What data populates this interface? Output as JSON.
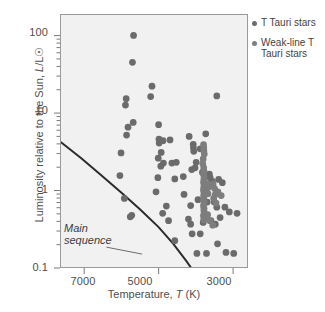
{
  "chart_data": {
    "type": "scatter",
    "title": "",
    "xlabel": "Temperature, T (K)",
    "ylabel": "Luminosity relative to the Sun, L/L☉",
    "xscale": "linear-reversed",
    "yscale": "log",
    "xlim": [
      7650,
      2600
    ],
    "ylim": [
      0.1,
      190
    ],
    "grid": false,
    "legend_position": "outside-right-top",
    "xticks": [
      7000,
      5000,
      3000
    ],
    "xtick_labels": [
      "7000",
      "5000",
      "3000"
    ],
    "yticks": [
      0.1,
      1,
      10,
      100
    ],
    "ytick_labels": [
      "0.1",
      "1",
      "10",
      "100"
    ],
    "annotations": [
      {
        "text_line1": "Main",
        "text_line2": "sequence",
        "style": "italic",
        "leader": "points up-right to the main-sequence curve"
      }
    ],
    "curves": [
      {
        "name": "main-sequence",
        "label": "Main sequence",
        "color": "#2b2b2b",
        "width": 2,
        "points": [
          [
            7650,
            4.2
          ],
          [
            7100,
            2.6
          ],
          [
            6550,
            1.55
          ],
          [
            6000,
            0.92
          ],
          [
            5500,
            0.56
          ],
          [
            5000,
            0.33
          ],
          [
            4600,
            0.2
          ],
          [
            4250,
            0.12
          ],
          [
            4120,
            0.098
          ]
        ]
      }
    ],
    "series": [
      {
        "name": "T Tauri stars",
        "marker": "circle",
        "color": "#6b6b6b",
        "size": 3.4,
        "points": [
          [
            5680,
            103
          ],
          [
            5710,
            46
          ],
          [
            5880,
            15.5
          ],
          [
            5900,
            12.8
          ],
          [
            5180,
            22.5
          ],
          [
            5215,
            16.5
          ],
          [
            3420,
            16.8
          ],
          [
            5830,
            6.6
          ],
          [
            5870,
            5.2
          ],
          [
            5690,
            7.6
          ],
          [
            5000,
            7.1
          ],
          [
            4990,
            4.6
          ],
          [
            4985,
            4.1
          ],
          [
            4880,
            4.4
          ],
          [
            4690,
            4.5
          ],
          [
            4170,
            5.0
          ],
          [
            3720,
            5.4
          ],
          [
            4060,
            3.95
          ],
          [
            4055,
            3.55
          ],
          [
            4045,
            3.2
          ],
          [
            3870,
            3.45
          ],
          [
            4930,
            3.1
          ],
          [
            6020,
            3.05
          ],
          [
            5010,
            2.6
          ],
          [
            4870,
            2.25
          ],
          [
            4940,
            2.05
          ],
          [
            4640,
            2.25
          ],
          [
            4520,
            2.3
          ],
          [
            3980,
            2.3
          ],
          [
            4010,
            1.95
          ],
          [
            6050,
            1.55
          ],
          [
            5020,
            1.45
          ],
          [
            4560,
            1.4
          ],
          [
            4330,
            1.5
          ],
          [
            4100,
            1.85
          ],
          [
            3810,
            1.7
          ],
          [
            3620,
            1.62
          ],
          [
            3600,
            1.45
          ],
          [
            3540,
            1.3
          ],
          [
            3560,
            1.15
          ],
          [
            3370,
            1.38
          ],
          [
            3270,
            1.25
          ],
          [
            5930,
            0.78
          ],
          [
            5070,
            0.95
          ],
          [
            4790,
            0.62
          ],
          [
            4310,
            0.88
          ],
          [
            4130,
            0.63
          ],
          [
            3930,
            0.75
          ],
          [
            3680,
            0.7
          ],
          [
            3490,
            0.7
          ],
          [
            3420,
            0.6
          ],
          [
            3200,
            0.6
          ],
          [
            3080,
            0.52
          ],
          [
            2870,
            0.5
          ],
          [
            5770,
            0.45
          ],
          [
            5730,
            0.47
          ],
          [
            4890,
            0.5
          ],
          [
            4730,
            0.4
          ],
          [
            4190,
            0.42
          ],
          [
            4130,
            0.36
          ],
          [
            3790,
            0.38
          ],
          [
            3580,
            0.4
          ],
          [
            3460,
            0.36
          ],
          [
            3330,
            0.44
          ],
          [
            4560,
            0.22
          ],
          [
            4090,
            0.27
          ],
          [
            3960,
            0.15
          ],
          [
            3700,
            0.15
          ],
          [
            3400,
            0.2
          ],
          [
            3170,
            0.155
          ],
          [
            2960,
            0.15
          ],
          [
            3870,
            0.27
          ]
        ]
      },
      {
        "name": "Weak-line T Tauri stars",
        "marker": "circle",
        "color": "#7d7d7d",
        "size": 3.4,
        "points": [
          [
            3780,
            3.9
          ],
          [
            3775,
            3.55
          ],
          [
            3770,
            3.25
          ],
          [
            3760,
            2.95
          ],
          [
            3790,
            2.55
          ],
          [
            3800,
            2.2
          ],
          [
            3775,
            1.95
          ],
          [
            3770,
            1.78
          ],
          [
            3782,
            1.62
          ],
          [
            3768,
            1.48
          ],
          [
            3772,
            1.36
          ],
          [
            3779,
            1.26
          ],
          [
            3766,
            1.17
          ],
          [
            3774,
            1.08
          ],
          [
            3781,
            1.0
          ],
          [
            3763,
            0.93
          ],
          [
            3776,
            0.86
          ],
          [
            3770,
            0.8
          ],
          [
            3784,
            0.745
          ],
          [
            3762,
            0.7
          ],
          [
            3773,
            0.655
          ],
          [
            3779,
            0.615
          ],
          [
            3767,
            0.575
          ],
          [
            3771,
            0.54
          ],
          [
            3758,
            0.5
          ],
          [
            3783,
            0.465
          ],
          [
            3765,
            0.435
          ],
          [
            3774,
            0.41
          ],
          [
            3690,
            1.22
          ],
          [
            3700,
            1.02
          ],
          [
            3660,
            0.9
          ],
          [
            3640,
            1.1
          ],
          [
            3520,
            1.2
          ],
          [
            3480,
            1.05
          ],
          [
            3460,
            0.88
          ],
          [
            3505,
            0.78
          ],
          [
            3440,
            0.68
          ],
          [
            3390,
            0.95
          ],
          [
            3300,
            0.85
          ],
          [
            3670,
            0.48
          ],
          [
            3610,
            0.4
          ],
          [
            3530,
            0.35
          ]
        ]
      }
    ]
  },
  "legend": {
    "items": [
      {
        "label": "T Tauri stars",
        "color": "#6b6b6b"
      },
      {
        "label": "Weak-line T Tauri stars",
        "color": "#7d7d7d"
      }
    ]
  },
  "axes": {
    "x_title_main": "Temperature,",
    "x_title_italic": "T",
    "x_title_unit": "(K)",
    "y_title_main": "Luminosity relative to the Sun,",
    "y_title_italic": "L",
    "y_title_unit": "/L☉"
  },
  "annotation": {
    "line1": "Main",
    "line2": "sequence"
  },
  "colors": {
    "plot_background": "#f1f1f1",
    "frame": "#9a9a9a",
    "text": "#4f4f4f",
    "curve": "#2b2b2b"
  }
}
